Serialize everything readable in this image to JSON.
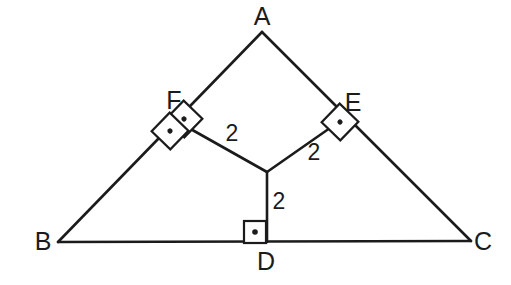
{
  "figure": {
    "kind": "euclidean-geometry-diagram",
    "canvas": {
      "width": 511,
      "height": 285
    },
    "stroke_color": "#1b1b1b",
    "background_color": "#ffffff"
  },
  "vertices": [
    {
      "id": "A",
      "label": "A",
      "x": 262,
      "y": 32,
      "label_x": 262,
      "label_y": 16
    },
    {
      "id": "B",
      "label": "B",
      "x": 58,
      "y": 242,
      "label_x": 43,
      "label_y": 241
    },
    {
      "id": "C",
      "label": "C",
      "x": 471,
      "y": 241,
      "label_x": 483,
      "label_y": 241
    },
    {
      "id": "D",
      "label": "D",
      "x": 267,
      "y": 242,
      "label_x": 266,
      "label_y": 261
    },
    {
      "id": "E",
      "label": "E",
      "x": 340,
      "y": 121,
      "label_x": 353,
      "label_y": 102
    },
    {
      "id": "F",
      "label": "F",
      "x": 180,
      "y": 123,
      "label_x": 174,
      "label_y": 100
    }
  ],
  "incenter": {
    "id": "I",
    "x": 267,
    "y": 172
  },
  "sides": [
    {
      "name": "side-AB",
      "from": "A",
      "to": "B"
    },
    {
      "name": "side-AC",
      "from": "A",
      "to": "C"
    },
    {
      "name": "side-BC",
      "from": "B",
      "to": "C"
    }
  ],
  "radii": [
    {
      "name": "radius-IF",
      "from": "I",
      "to": "F",
      "length_label": "2",
      "label_x": 232,
      "label_y": 133
    },
    {
      "name": "radius-IE",
      "from": "I",
      "to": "E",
      "length_label": "2",
      "label_x": 314,
      "label_y": 152
    },
    {
      "name": "radius-ID",
      "from": "I",
      "to": "D",
      "length_label": "2",
      "label_x": 279,
      "label_y": 201
    }
  ],
  "right_angle_markers": [
    {
      "name": "right-angle-marker-f-outer",
      "center_x": 184,
      "center_y": 119,
      "half_size": 13,
      "rotation_deg": -46,
      "dot": true
    },
    {
      "name": "right-angle-marker-f-inner",
      "center_x": 170,
      "center_y": 131,
      "half_size": 13,
      "rotation_deg": -46,
      "dot": true
    },
    {
      "name": "right-angle-marker-e",
      "center_x": 340,
      "center_y": 122,
      "half_size": 13,
      "rotation_deg": 44,
      "dot": true
    },
    {
      "name": "right-angle-marker-d",
      "center_x": 255,
      "center_y": 232,
      "half_size": 11,
      "rotation_deg": 0,
      "dot": true
    }
  ],
  "measure_labels": [
    {
      "text": "2",
      "for": "radius-IF"
    },
    {
      "text": "2",
      "for": "radius-IE"
    },
    {
      "text": "2",
      "for": "radius-ID"
    }
  ]
}
